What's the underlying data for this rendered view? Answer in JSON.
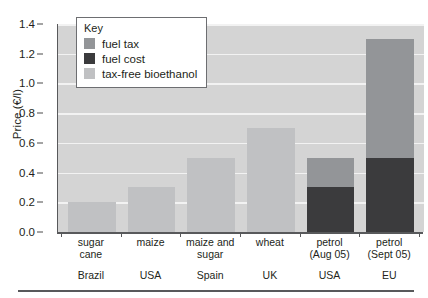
{
  "chart_data": {
    "type": "bar",
    "title": "",
    "xlabel": "",
    "ylabel": "Price (€/l)",
    "ylim": [
      0.0,
      1.4
    ],
    "ytick_labels": [
      "0.0",
      "0.2",
      "0.4",
      "0.6",
      "0.8",
      "1.0",
      "1.2",
      "1.4"
    ],
    "ytick_values": [
      0.0,
      0.2,
      0.4,
      0.6,
      0.8,
      1.0,
      1.2,
      1.4
    ],
    "grid": true,
    "stacked": true,
    "legend_position": "top-left-inside",
    "categories": [
      "sugar cane",
      "maize",
      "maize and sugar",
      "wheat",
      "petrol (Aug 05)",
      "petrol (Sept 05)"
    ],
    "category_lines": [
      {
        "line1": "sugar",
        "line2": "cane",
        "country": "Brazil"
      },
      {
        "line1": "maize",
        "line2": "",
        "country": "USA"
      },
      {
        "line1": "maize and",
        "line2": "sugar",
        "country": "Spain"
      },
      {
        "line1": "wheat",
        "line2": "",
        "country": "UK"
      },
      {
        "line1": "petrol",
        "line2": "(Aug 05)",
        "country": "USA"
      },
      {
        "line1": "petrol",
        "line2": "(Sept 05)",
        "country": "EU"
      }
    ],
    "series": [
      {
        "name": "tax-free bioethanol",
        "color": "#c0c1c3",
        "values": [
          0.2,
          0.3,
          0.5,
          0.7,
          0.0,
          0.0
        ]
      },
      {
        "name": "fuel cost",
        "color": "#3b3b3d",
        "values": [
          0.0,
          0.0,
          0.0,
          0.0,
          0.3,
          0.5
        ]
      },
      {
        "name": "fuel tax",
        "color": "#939598",
        "values": [
          0.0,
          0.0,
          0.0,
          0.0,
          0.2,
          0.8
        ]
      }
    ],
    "totals": [
      0.2,
      0.3,
      0.5,
      0.7,
      0.5,
      1.3
    ]
  },
  "legend": {
    "title": "Key",
    "entries": [
      {
        "label": "fuel tax",
        "color": "#939598",
        "key": "tax"
      },
      {
        "label": "fuel cost",
        "color": "#3b3b3d",
        "key": "cost"
      },
      {
        "label": "tax-free bioethanol",
        "color": "#c0c1c3",
        "key": "bio"
      }
    ]
  },
  "colors": {
    "plot_background": "#d4d4d4",
    "gridline": "#f2f2f2",
    "axis": "#58595b",
    "fuel_tax": "#939598",
    "fuel_cost": "#3b3b3d",
    "tax_free_bioethanol": "#c0c1c3",
    "text": "#231f20"
  }
}
